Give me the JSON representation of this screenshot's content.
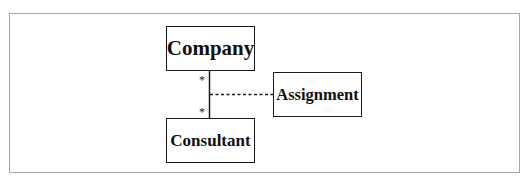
{
  "diagram": {
    "type": "UML class diagram with association class",
    "classes": [
      {
        "id": "company",
        "label": "Company"
      },
      {
        "id": "consultant",
        "label": "Consultant"
      },
      {
        "id": "assignment",
        "label": "Assignment"
      }
    ],
    "association": {
      "from": "Company",
      "to": "Consultant",
      "multiplicity_from": "*",
      "multiplicity_to": "*",
      "association_class": "Assignment",
      "association_class_link": "dashed"
    },
    "colors": {
      "frame_border": "#a8a8a8",
      "box_border": "#1a1a1a",
      "text": "#111111",
      "background": "#ffffff"
    }
  }
}
